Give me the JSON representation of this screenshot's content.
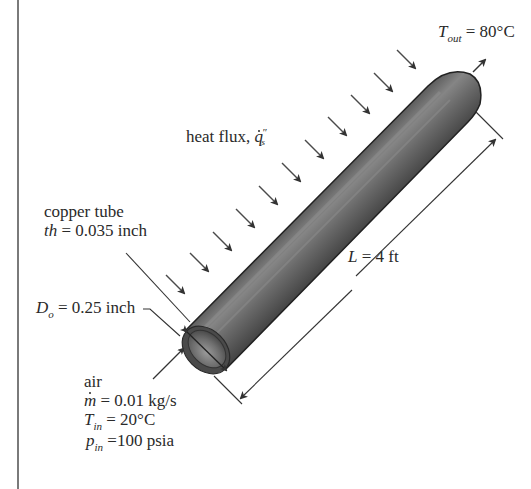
{
  "figure": {
    "colors": {
      "tube_dark": "#3c3c3c",
      "tube_mid": "#6b6b6b",
      "tube_highlight": "#8e8e8e",
      "arrow": "#3a3a3a",
      "text": "#2a2a2a",
      "rule": "#7a7a7a"
    }
  },
  "labels": {
    "outlet_temp": {
      "symbol": "T",
      "subscript": "out",
      "value": "= 80°C"
    },
    "heat_flux": {
      "text": "heat flux, ",
      "symbol": "q",
      "superscript": "″",
      "subscript": "s"
    },
    "copper_tube": {
      "line1": "copper tube",
      "symbol": "th",
      "value": " = 0.035 inch"
    },
    "outer_diameter": {
      "symbol": "D",
      "subscript": "o",
      "value": " = 0.25 inch"
    },
    "length": {
      "symbol": "L",
      "value": " = 4 ft"
    },
    "air": {
      "line1": "air",
      "mass_flow_symbol": "m",
      "mass_flow_value": " = 0.01 kg/s",
      "inlet_temp_symbol": "T",
      "inlet_temp_subscript": "in",
      "inlet_temp_value": " = 20°C",
      "inlet_pressure_symbol": "p",
      "inlet_pressure_subscript": "in",
      "inlet_pressure_value": " =100 psia"
    }
  },
  "icons": {
    "heat_flux_arrows": "arrow-down-right",
    "outlet_flow_arrow": "arrow-up-right",
    "inlet_flow_arrow": "arrow-up-right",
    "dimension_arrows": "double-headed-arrow"
  }
}
